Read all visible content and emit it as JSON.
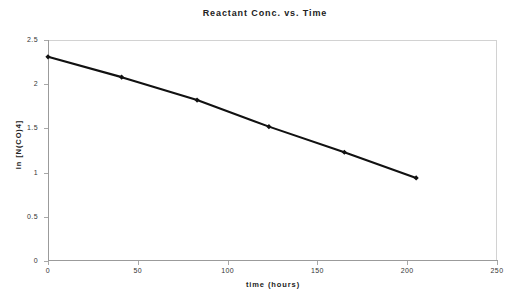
{
  "chart_data": {
    "type": "line",
    "title": "Reactant  Conc.  vs.  Time",
    "xlabel": "time   (hours)",
    "ylabel": "ln  [N(CO)4]",
    "x": [
      0,
      41,
      83,
      123,
      165,
      205
    ],
    "values": [
      2.31,
      2.08,
      1.82,
      1.52,
      1.23,
      0.94
    ],
    "series": [
      {
        "name": "ln [N(CO)4]",
        "x": [
          0,
          41,
          83,
          123,
          165,
          205
        ],
        "values": [
          2.31,
          2.08,
          1.82,
          1.52,
          1.23,
          0.94
        ]
      }
    ],
    "xlim": [
      0,
      250
    ],
    "ylim": [
      0,
      2.5
    ],
    "xticks": [
      0,
      50,
      100,
      150,
      200,
      250
    ],
    "yticks": [
      0,
      0.5,
      1,
      1.5,
      2,
      2.5
    ],
    "xticklabels": [
      "0",
      "50",
      "100",
      "150",
      "200",
      "250"
    ],
    "yticklabels": [
      "0",
      "0.5",
      "1",
      "1.5",
      "2",
      "2.5"
    ],
    "grid": false,
    "legend": false,
    "legend_position": "none",
    "line_color": "#111111",
    "marker_color": "#111111",
    "marker": "diamond",
    "annotations": []
  },
  "colors": {
    "background": "#ffffff",
    "axis": "#9b9b9b",
    "frame": "#d2d2d2",
    "text": "#222222",
    "line": "#111111"
  }
}
